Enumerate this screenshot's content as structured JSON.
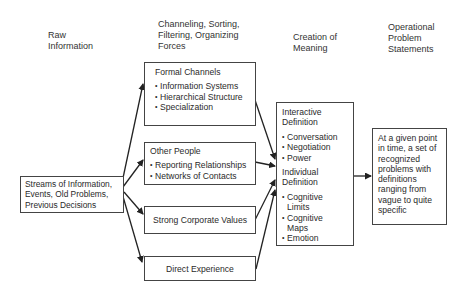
{
  "headers": {
    "raw": [
      "Raw",
      "Information"
    ],
    "channeling": [
      "Channeling, Sorting,",
      "Filtering, Organizing",
      "Forces"
    ],
    "creation": [
      "Creation of",
      "Meaning"
    ],
    "operational": [
      "Operational",
      "Problem",
      "Statements"
    ]
  },
  "input_box": {
    "lines": [
      "Streams of Information,",
      "Events, Old Problems,",
      "Previous Decisions"
    ]
  },
  "forces": [
    {
      "title": "Formal Channels",
      "items": [
        "Information Systems",
        "Hierarchical Structure",
        "Specialization"
      ]
    },
    {
      "title": "Other People",
      "items": [
        "Reporting Relationships",
        "Networks of Contacts"
      ]
    },
    {
      "title": "Strong Corporate Values",
      "items": []
    },
    {
      "title": "Direct Experience",
      "items": []
    }
  ],
  "meaning_box": {
    "interactive_title": [
      "Interactive",
      "Definition"
    ],
    "interactive_items": [
      "Conversation",
      "Negotiation",
      "Power"
    ],
    "individual_title": [
      "Individual",
      "Definition"
    ],
    "individual_items": [
      "Cognitive Limits",
      "Cognitive Maps",
      "Emotion"
    ]
  },
  "output_box": {
    "lines": [
      "At a given point",
      "in time, a set of",
      "recognized",
      "problems with",
      "definitions",
      "ranging from",
      "vague to quite",
      "specific"
    ]
  }
}
